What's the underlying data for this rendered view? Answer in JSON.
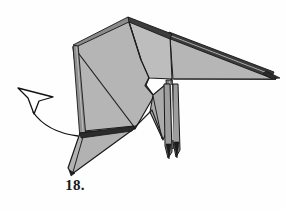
{
  "figure": {
    "kind": "origami-instruction-diagram",
    "step_label": "18.",
    "background_color": "#fefefe",
    "paper": {
      "front_fill": "#b3b3b3",
      "front_fill_light": "#c3c3c3",
      "shadow_fill": "#9a9a9a",
      "edge_fill": "#d9d9d9",
      "outline_color": "#1a1a1a",
      "crease_color": "#222222"
    },
    "arrow": {
      "name": "fold-direction-arrow",
      "style": "hollow outlined arrowhead with curved tail",
      "direction": "up-left",
      "stroke_color": "#111111",
      "fill_color": "#ffffff",
      "tail_start": "78,136",
      "head_tip": "18,88"
    },
    "parts": [
      {
        "name": "head-body-panel",
        "fill": "#b3b3b3"
      },
      {
        "name": "upper-back-panel",
        "fill": "#bcbcbc"
      },
      {
        "name": "tail-wedge",
        "fill": "#b8b8b8"
      },
      {
        "name": "rear-leg",
        "fill": "#a8a8a8"
      },
      {
        "name": "front-leg",
        "fill": "#a8a8a8"
      },
      {
        "name": "lower-flap",
        "fill": "#b0b0b0"
      },
      {
        "name": "left-layer-edge",
        "fill": "#8f8f8f"
      }
    ]
  }
}
